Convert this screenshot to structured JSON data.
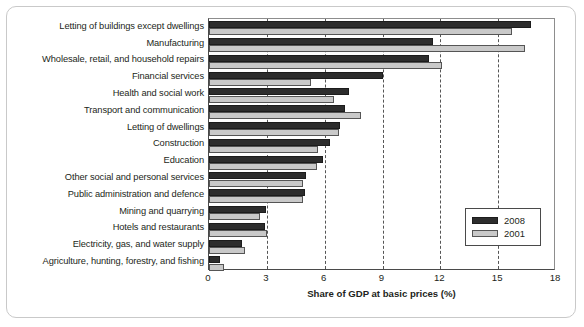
{
  "chart_data": {
    "type": "bar",
    "orientation": "horizontal",
    "title": "",
    "xlabel": "Share of GDP at basic prices (%)",
    "ylabel": "",
    "xlim": [
      0,
      18
    ],
    "xticks": [
      0,
      3,
      6,
      9,
      12,
      15,
      18
    ],
    "grid": "vertical-dashed",
    "legend_position": "middle-right",
    "categories": [
      "Letting of buildings except dwellings",
      "Manufacturing",
      "Wholesale, retail, and household repairs",
      "Financial services",
      "Health and social work",
      "Transport and communication",
      "Letting of dwellings",
      "Construction",
      "Education",
      "Other social and personal services",
      "Public administration and defence",
      "Mining and quarrying",
      "Hotels and restaurants",
      "Electricity, gas, and water supply",
      "Agriculture, hunting, forestry, and fishing"
    ],
    "series": [
      {
        "name": "2008",
        "color": "#2d2d2d",
        "values": [
          16.7,
          11.6,
          11.4,
          9.0,
          7.25,
          7.05,
          6.8,
          6.3,
          5.9,
          5.05,
          5.0,
          2.95,
          2.9,
          1.7,
          0.55
        ]
      },
      {
        "name": "2001",
        "color": "#c9c9c9",
        "values": [
          15.7,
          16.4,
          12.1,
          5.3,
          6.5,
          7.9,
          6.75,
          5.65,
          5.6,
          4.9,
          4.9,
          2.65,
          3.0,
          1.85,
          0.8
        ]
      }
    ]
  }
}
